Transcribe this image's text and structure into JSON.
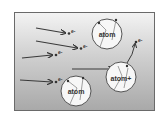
{
  "diagram": {
    "atoms": [
      {
        "label": "atom",
        "cx": 107,
        "cy": 34,
        "r": 15
      },
      {
        "label": "atom+",
        "cx": 121,
        "cy": 77,
        "r": 15
      },
      {
        "label": "atom",
        "cx": 76,
        "cy": 91,
        "r": 15
      }
    ],
    "electron_label": "e-",
    "electrons": [
      {
        "label": "e-"
      },
      {
        "label": "e-"
      },
      {
        "label": "e-"
      },
      {
        "label": "e-"
      },
      {
        "label": "e-"
      },
      {
        "label": "e-"
      }
    ],
    "colors": {
      "arrow": "#3a3a3a",
      "atom_fill": "#f7f7f7",
      "atom_stroke": "#555555"
    }
  }
}
